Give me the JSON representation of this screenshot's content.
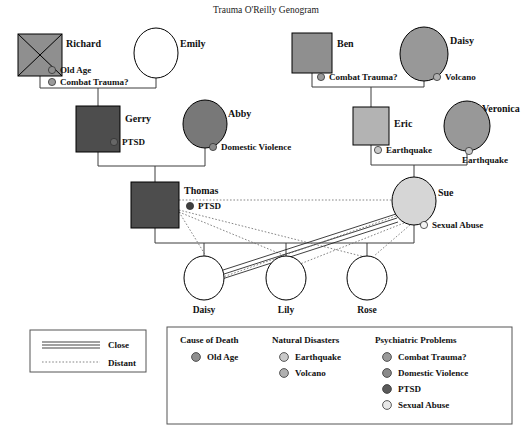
{
  "title": "Trauma O'Reilly Genogram",
  "colors": {
    "combat_trauma": "#9a9a9a",
    "domestic_violence": "#8a8a8a",
    "ptsd": "#666666",
    "sexual_abuse": "#e0e0e0",
    "old_age": "#8e8e8e",
    "earthquake": "#c9c9c9",
    "volcano": "#b0b0b0",
    "male_dark": "#4d4d4d",
    "male_mid": "#8f8f8f",
    "male_light": "#b3b3b3",
    "female_mid": "#989898",
    "female_light": "#d6d6d6",
    "blank": "#ffffff",
    "line": "#3d3d3d"
  },
  "people": [
    {
      "id": "richard",
      "name": "Richard",
      "shape": "square",
      "deceased": true,
      "fill": "#8f8f8f",
      "x": 18,
      "y": 34,
      "w": 44,
      "h": 42,
      "label_x": 66,
      "label_y": 47,
      "markers": [
        {
          "label": "Old Age",
          "color": "#8e8e8e",
          "dot_x": 52,
          "dot_y": 70,
          "text_x": 60,
          "text_y": 73
        },
        {
          "label": "Combat Trauma?",
          "color": "#9a9a9a",
          "dot_x": 52,
          "dot_y": 82,
          "text_x": 60,
          "text_y": 85
        }
      ]
    },
    {
      "id": "emily",
      "name": "Emily",
      "shape": "circle",
      "deceased": false,
      "fill": "#ffffff",
      "cx": 156,
      "cy": 53,
      "rx": 22,
      "ry": 25,
      "label_x": 180,
      "label_y": 47,
      "markers": []
    },
    {
      "id": "ben",
      "name": "Ben",
      "shape": "square",
      "deceased": false,
      "fill": "#8f8f8f",
      "x": 292,
      "y": 33,
      "w": 40,
      "h": 40,
      "label_x": 337,
      "label_y": 47,
      "markers": [
        {
          "label": "Combat Trauma?",
          "color": "#9a9a9a",
          "dot_x": 321,
          "dot_y": 77,
          "text_x": 329,
          "text_y": 80
        }
      ]
    },
    {
      "id": "daisy_gm",
      "name": "Daisy",
      "shape": "circle",
      "deceased": false,
      "fill": "#989898",
      "cx": 424,
      "cy": 54,
      "rx": 24,
      "ry": 27,
      "label_x": 450,
      "label_y": 44,
      "markers": [
        {
          "label": "Volcano",
          "color": "#b0b0b0",
          "dot_x": 437,
          "dot_y": 77,
          "text_x": 445,
          "text_y": 80
        }
      ]
    },
    {
      "id": "gerry",
      "name": "Gerry",
      "shape": "square",
      "deceased": false,
      "fill": "#4d4d4d",
      "x": 76,
      "y": 106,
      "w": 44,
      "h": 46,
      "label_x": 125,
      "label_y": 122,
      "markers": [
        {
          "label": "PTSD",
          "color": "#666666",
          "dot_x": 114,
          "dot_y": 142,
          "text_x": 122,
          "text_y": 145
        }
      ]
    },
    {
      "id": "abby",
      "name": "Abby",
      "shape": "circle",
      "deceased": false,
      "fill": "#787878",
      "cx": 205,
      "cy": 124,
      "rx": 22,
      "ry": 24,
      "label_x": 228,
      "label_y": 117,
      "markers": [
        {
          "label": "Domestic Violence",
          "color": "#8a8a8a",
          "dot_x": 213,
          "dot_y": 147,
          "text_x": 221,
          "text_y": 150
        }
      ]
    },
    {
      "id": "eric",
      "name": "Eric",
      "shape": "square",
      "deceased": false,
      "fill": "#b3b3b3",
      "x": 353,
      "y": 107,
      "w": 36,
      "h": 38,
      "label_x": 394,
      "label_y": 127,
      "markers": [
        {
          "label": "Earthquake",
          "color": "#c9c9c9",
          "dot_x": 378,
          "dot_y": 150,
          "text_x": 386,
          "text_y": 153
        }
      ]
    },
    {
      "id": "veronica",
      "name": "Veronica",
      "shape": "circle",
      "deceased": false,
      "fill": "#989898",
      "cx": 467,
      "cy": 126,
      "rx": 23,
      "ry": 25,
      "label_x": 482,
      "label_y": 112,
      "markers": [
        {
          "label": "Earthquake",
          "color": "#c9c9c9",
          "dot_x": 469,
          "dot_y": 151,
          "text_x": 462,
          "text_y": 163
        }
      ]
    },
    {
      "id": "thomas",
      "name": "Thomas",
      "shape": "square",
      "deceased": false,
      "fill": "#4d4d4d",
      "x": 131,
      "y": 182,
      "w": 48,
      "h": 46,
      "label_x": 184,
      "label_y": 194,
      "markers": [
        {
          "label": "PTSD",
          "color": "#3f3f3f",
          "dot_x": 190,
          "dot_y": 206,
          "text_x": 198,
          "text_y": 209
        }
      ]
    },
    {
      "id": "sue",
      "name": "Sue",
      "shape": "circle",
      "deceased": false,
      "fill": "#d6d6d6",
      "cx": 414,
      "cy": 201,
      "rx": 22,
      "ry": 24,
      "label_x": 438,
      "label_y": 196,
      "markers": [
        {
          "label": "Sexual Abuse",
          "color": "#f2f2f2",
          "dot_x": 424,
          "dot_y": 225,
          "text_x": 432,
          "text_y": 228
        }
      ]
    },
    {
      "id": "daisy_child",
      "name": "Daisy",
      "shape": "circle",
      "deceased": false,
      "fill": "#ffffff",
      "cx": 204,
      "cy": 278,
      "rx": 20,
      "ry": 22,
      "label_x": 204,
      "label_y": 313,
      "markers": []
    },
    {
      "id": "lily",
      "name": "Lily",
      "shape": "circle",
      "deceased": false,
      "fill": "#ffffff",
      "cx": 286,
      "cy": 278,
      "rx": 20,
      "ry": 22,
      "label_x": 286,
      "label_y": 313,
      "markers": []
    },
    {
      "id": "rose",
      "name": "Rose",
      "shape": "circle",
      "deceased": false,
      "fill": "#ffffff",
      "cx": 367,
      "cy": 278,
      "rx": 20,
      "ry": 22,
      "label_x": 367,
      "label_y": 313,
      "markers": []
    }
  ],
  "legend_lines": {
    "box": {
      "x": 30,
      "y": 330,
      "w": 116,
      "h": 42
    },
    "items": [
      {
        "label": "Close",
        "style": "close",
        "y": 344,
        "text_x": 110
      },
      {
        "label": "Distant",
        "style": "distant",
        "y": 361,
        "text_x": 110
      }
    ]
  },
  "legend_main": {
    "box": {
      "x": 167,
      "y": 327,
      "w": 345,
      "h": 97
    },
    "groups": [
      {
        "title": "Cause of Death",
        "title_x": 180,
        "title_y": 343,
        "items": [
          {
            "label": "Old Age",
            "color": "#8e8e8e",
            "dot_x": 196,
            "dot_y": 357,
            "text_x": 207,
            "text_y": 360
          }
        ]
      },
      {
        "title": "Natural Disasters",
        "title_x": 272,
        "title_y": 343,
        "items": [
          {
            "label": "Earthquake",
            "color": "#c9c9c9",
            "dot_x": 284,
            "dot_y": 357,
            "text_x": 295,
            "text_y": 360
          },
          {
            "label": "Volcano",
            "color": "#b0b0b0",
            "dot_x": 284,
            "dot_y": 373,
            "text_x": 295,
            "text_y": 376
          }
        ]
      },
      {
        "title": "Psychiatric Problems",
        "title_x": 375,
        "title_y": 343,
        "items": [
          {
            "label": "Combat Trauma?",
            "color": "#9a9a9a",
            "dot_x": 387,
            "dot_y": 357,
            "text_x": 398,
            "text_y": 360
          },
          {
            "label": "Domestic Violence",
            "color": "#8a8a8a",
            "dot_x": 387,
            "dot_y": 373,
            "text_x": 398,
            "text_y": 376
          },
          {
            "label": "PTSD",
            "color": "#5a5a5a",
            "dot_x": 387,
            "dot_y": 389,
            "text_x": 398,
            "text_y": 392
          },
          {
            "label": "Sexual Abuse",
            "color": "#e8e8e8",
            "dot_x": 387,
            "dot_y": 405,
            "text_x": 398,
            "text_y": 408
          }
        ]
      }
    ]
  },
  "relationships": [
    {
      "from": "thomas",
      "to": "sue",
      "style": "distant"
    },
    {
      "from": "thomas",
      "to": "lily",
      "style": "distant"
    },
    {
      "from": "thomas",
      "to": "rose",
      "style": "distant"
    },
    {
      "from": "thomas",
      "to": "daisy_child",
      "style": "distant"
    },
    {
      "from": "sue",
      "to": "daisy_child",
      "style": "close"
    },
    {
      "from": "sue",
      "to": "lily",
      "style": "distant"
    },
    {
      "from": "sue",
      "to": "rose",
      "style": "distant"
    }
  ]
}
